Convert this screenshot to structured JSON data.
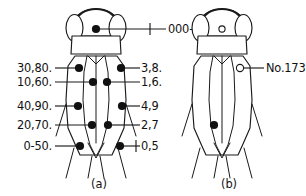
{
  "figure": {
    "ink_color": "#1a1a1a",
    "background_color": "#ffffff"
  },
  "panels": [
    {
      "id": "a",
      "caption": "(a)",
      "caption_x": 99,
      "caption_y": 184,
      "description": "code key panel"
    },
    {
      "id": "b",
      "caption": "(b)",
      "caption_x": 229,
      "caption_y": 184,
      "description": "example individual panel"
    }
  ],
  "panel_a": {
    "head_label": {
      "text": "000-900",
      "x": 168,
      "y": 32,
      "anchor": "start",
      "leader": {
        "x1": 96,
        "y1": 29,
        "x2": 166,
        "y2": 29
      },
      "tick": {
        "x": 150,
        "y1": 23,
        "y2": 35
      }
    },
    "left_labels": [
      {
        "text": "30,80.",
        "x": 52,
        "y": 72,
        "leader": {
          "x1": 55,
          "y1": 68,
          "x2": 79,
          "y2": 68
        }
      },
      {
        "text": "10,60.",
        "x": 52,
        "y": 86,
        "leader": {
          "x1": 55,
          "y1": 82,
          "x2": 93,
          "y2": 82
        }
      },
      {
        "text": "40,90.",
        "x": 52,
        "y": 110,
        "leader": {
          "x1": 55,
          "y1": 106,
          "x2": 78,
          "y2": 106
        }
      },
      {
        "text": "20,70.",
        "x": 52,
        "y": 129,
        "leader": {
          "x1": 55,
          "y1": 125,
          "x2": 92,
          "y2": 125
        }
      },
      {
        "text": "0-50.",
        "x": 52,
        "y": 150,
        "leader": {
          "x1": 55,
          "y1": 146,
          "x2": 80,
          "y2": 146
        }
      }
    ],
    "right_labels": [
      {
        "text": "3,8.",
        "x": 141,
        "y": 72,
        "leader": {
          "x1": 121,
          "y1": 68,
          "x2": 140,
          "y2": 68
        },
        "tick": null
      },
      {
        "text": "1,6.",
        "x": 141,
        "y": 86,
        "leader": {
          "x1": 107,
          "y1": 82,
          "x2": 140,
          "y2": 82
        },
        "tick": null
      },
      {
        "text": "4,9",
        "x": 141,
        "y": 110,
        "leader": {
          "x1": 122,
          "y1": 106,
          "x2": 140,
          "y2": 106
        },
        "tick": null
      },
      {
        "text": "2,7",
        "x": 141,
        "y": 129,
        "leader": {
          "x1": 108,
          "y1": 125,
          "x2": 140,
          "y2": 125
        },
        "tick": null
      },
      {
        "text": "0,5",
        "x": 141,
        "y": 150,
        "leader": {
          "x1": 120,
          "y1": 146,
          "x2": 140,
          "y2": 146
        },
        "tick": {
          "x": 136,
          "y1": 140,
          "y2": 152
        }
      }
    ],
    "marker_dots": [
      {
        "code": "000-900",
        "x": 96,
        "y": 29,
        "r": 4.1,
        "style": "filled",
        "region": "head-center"
      },
      {
        "code": "30,80",
        "x": 79,
        "y": 68,
        "r": 4.1,
        "style": "filled",
        "region": "thorax-left-outer"
      },
      {
        "code": "3,8",
        "x": 121,
        "y": 68,
        "r": 4.1,
        "style": "filled",
        "region": "thorax-right-outer"
      },
      {
        "code": "10,60",
        "x": 93,
        "y": 82,
        "r": 4.1,
        "style": "filled",
        "region": "thorax-left-inner"
      },
      {
        "code": "1,6",
        "x": 107,
        "y": 82,
        "r": 4.1,
        "style": "filled",
        "region": "thorax-right-inner"
      },
      {
        "code": "40,90",
        "x": 78,
        "y": 106,
        "r": 4.1,
        "style": "filled",
        "region": "abdomen-left-outer"
      },
      {
        "code": "4,9",
        "x": 122,
        "y": 106,
        "r": 4.1,
        "style": "filled",
        "region": "abdomen-right-outer"
      },
      {
        "code": "20,70",
        "x": 92,
        "y": 125,
        "r": 4.1,
        "style": "filled",
        "region": "abdomen-left-inner"
      },
      {
        "code": "2,7",
        "x": 108,
        "y": 125,
        "r": 4.1,
        "style": "filled",
        "region": "abdomen-right-inner"
      },
      {
        "code": "0-50",
        "x": 80,
        "y": 146,
        "r": 4.1,
        "style": "filled",
        "region": "abdomen-tip-left"
      },
      {
        "code": "0,5",
        "x": 120,
        "y": 146,
        "r": 4.1,
        "style": "filled",
        "region": "abdomen-tip-right"
      }
    ]
  },
  "panel_b": {
    "label": {
      "text": "No.173",
      "x": 266,
      "y": 72,
      "anchor": "start",
      "leader": {
        "x1": 243,
        "y1": 68,
        "x2": 264,
        "y2": 68
      }
    },
    "marker_dots": [
      {
        "x": 222,
        "y": 29,
        "r": 3.1,
        "style": "open",
        "region": "head-center"
      },
      {
        "x": 240,
        "y": 68,
        "r": 3.6,
        "style": "open",
        "region": "thorax-right-outer"
      },
      {
        "x": 214,
        "y": 125,
        "r": 4.1,
        "style": "filled",
        "region": "abdomen-left-inner"
      }
    ]
  }
}
